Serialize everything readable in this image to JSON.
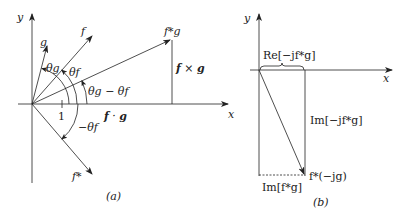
{
  "panel_a": {
    "caption": "(a)",
    "axis_x": "x",
    "axis_y": "y",
    "vectors": {
      "g": "g",
      "f": "f",
      "fstar_g": "f*g",
      "fstar": "f*"
    },
    "angles": {
      "theta_g": "θg",
      "theta_f": "θf",
      "diff": "θg − θf",
      "neg_theta_f": "−θf"
    },
    "tick_one": "1",
    "dot_label_f": "f",
    "dot_label_sep": " · ",
    "dot_label_g": "g",
    "cross_label_f": "f",
    "cross_label_sep": " × ",
    "cross_label_g": "g"
  },
  "panel_b": {
    "caption": "(b)",
    "axis_x": "x",
    "axis_y": "y",
    "re_label": "Re[−jf*g]",
    "im_label": "Im[−jf*g]",
    "im_fg_label": "Im[f*g]",
    "tip_label": "f*(−jg)"
  }
}
